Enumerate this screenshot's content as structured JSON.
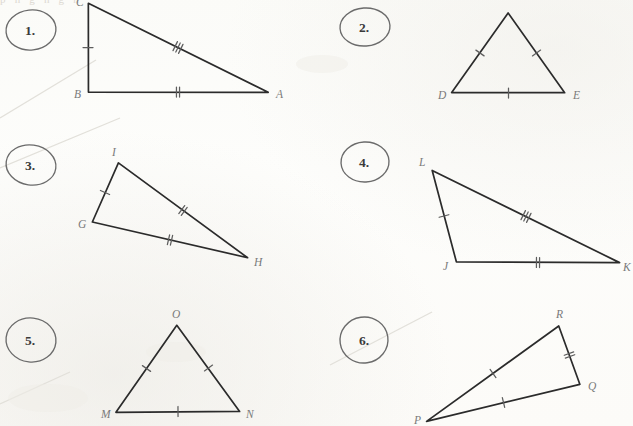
{
  "page": {
    "background_color": "#fdfdfb",
    "ink_color": "#2b2b2b",
    "label_color": "#7a7a7a",
    "header_ghost_text": "p   n   g   n   g   n"
  },
  "problems": [
    {
      "number": "1.",
      "number_pos": {
        "x": 30,
        "y": 35
      },
      "oval": {
        "cx": 31,
        "cy": 30,
        "rx": 25,
        "ry": 20,
        "rot": -6
      },
      "vertices": [
        {
          "label": "C",
          "x": 88,
          "y": 3,
          "lx": 76,
          "ly": 6
        },
        {
          "label": "B",
          "x": 88,
          "y": 92,
          "lx": 74,
          "ly": 98
        },
        {
          "label": "A",
          "x": 268,
          "y": 92,
          "lx": 276,
          "ly": 98
        }
      ],
      "sides": [
        {
          "from": "C",
          "to": "B",
          "ticks": 1
        },
        {
          "from": "B",
          "to": "A",
          "ticks": 2
        },
        {
          "from": "C",
          "to": "A",
          "ticks": 3
        }
      ]
    },
    {
      "number": "2.",
      "number_pos": {
        "x": 364,
        "y": 32
      },
      "oval": {
        "cx": 365,
        "cy": 27,
        "rx": 25,
        "ry": 19,
        "rot": -4
      },
      "vertices": [
        {
          "label": "",
          "x": 508,
          "y": 13,
          "lx": 504,
          "ly": 8
        },
        {
          "label": "D",
          "x": 452,
          "y": 93,
          "lx": 438,
          "ly": 99
        },
        {
          "label": "E",
          "x": 565,
          "y": 93,
          "lx": 573,
          "ly": 99
        }
      ],
      "sides": [
        {
          "from": "",
          "to": "D",
          "ticks": 1
        },
        {
          "from": "D",
          "to": "E",
          "ticks": 1
        },
        {
          "from": "",
          "to": "E",
          "ticks": 1
        }
      ]
    },
    {
      "number": "3.",
      "number_pos": {
        "x": 30,
        "y": 170
      },
      "oval": {
        "cx": 31,
        "cy": 165,
        "rx": 25,
        "ry": 20,
        "rot": 8
      },
      "vertices": [
        {
          "label": "I",
          "x": 118,
          "y": 163,
          "lx": 112,
          "ly": 156
        },
        {
          "label": "G",
          "x": 92,
          "y": 222,
          "lx": 78,
          "ly": 228
        },
        {
          "label": "H",
          "x": 248,
          "y": 258,
          "lx": 254,
          "ly": 266
        }
      ],
      "sides": [
        {
          "from": "G",
          "to": "I",
          "ticks": 1
        },
        {
          "from": "I",
          "to": "H",
          "ticks": 2
        },
        {
          "from": "G",
          "to": "H",
          "ticks": 2
        }
      ]
    },
    {
      "number": "4.",
      "number_pos": {
        "x": 364,
        "y": 167
      },
      "oval": {
        "cx": 365,
        "cy": 162,
        "rx": 24,
        "ry": 20,
        "rot": -3
      },
      "vertices": [
        {
          "label": "L",
          "x": 432,
          "y": 170,
          "lx": 419,
          "ly": 166
        },
        {
          "label": "J",
          "x": 456,
          "y": 262,
          "lx": 443,
          "ly": 270
        },
        {
          "label": "K",
          "x": 620,
          "y": 263,
          "lx": 623,
          "ly": 271
        }
      ],
      "sides": [
        {
          "from": "L",
          "to": "J",
          "ticks": 1
        },
        {
          "from": "J",
          "to": "K",
          "ticks": 2
        },
        {
          "from": "L",
          "to": "K",
          "ticks": 3
        }
      ]
    },
    {
      "number": "5.",
      "number_pos": {
        "x": 30,
        "y": 345
      },
      "oval": {
        "cx": 31,
        "cy": 340,
        "rx": 25,
        "ry": 22,
        "rot": 6
      },
      "vertices": [
        {
          "label": "O",
          "x": 177,
          "y": 325,
          "lx": 172,
          "ly": 318
        },
        {
          "label": "M",
          "x": 116,
          "y": 412,
          "lx": 101,
          "ly": 418
        },
        {
          "label": "N",
          "x": 240,
          "y": 411,
          "lx": 246,
          "ly": 418
        }
      ],
      "sides": [
        {
          "from": "O",
          "to": "M",
          "ticks": 1
        },
        {
          "from": "M",
          "to": "N",
          "ticks": 1
        },
        {
          "from": "O",
          "to": "N",
          "ticks": 1
        }
      ]
    },
    {
      "number": "6.",
      "number_pos": {
        "x": 364,
        "y": 345
      },
      "oval": {
        "cx": 364,
        "cy": 340,
        "rx": 24,
        "ry": 23,
        "rot": -8
      },
      "vertices": [
        {
          "label": "R",
          "x": 559,
          "y": 326,
          "lx": 556,
          "ly": 318
        },
        {
          "label": "Q",
          "x": 580,
          "y": 384,
          "lx": 588,
          "ly": 390
        },
        {
          "label": "P",
          "x": 427,
          "y": 421,
          "lx": 414,
          "ly": 424
        }
      ],
      "sides": [
        {
          "from": "P",
          "to": "R",
          "ticks": 1
        },
        {
          "from": "R",
          "to": "Q",
          "ticks": 2
        },
        {
          "from": "P",
          "to": "Q",
          "ticks": 1
        }
      ]
    }
  ],
  "scan_artifacts": [
    {
      "name": "diagonal-streak-upper-left",
      "x1": 0,
      "y1": 168,
      "x2": 120,
      "y2": 118
    },
    {
      "name": "diagonal-streak-lower-left",
      "x1": 0,
      "y1": 118,
      "x2": 96,
      "y2": 60
    },
    {
      "name": "diagonal-streak-problem-six",
      "x1": 330,
      "y1": 365,
      "x2": 432,
      "y2": 312
    },
    {
      "name": "diagonal-streak-bottom-left",
      "x1": 0,
      "y1": 404,
      "x2": 70,
      "y2": 372
    }
  ]
}
